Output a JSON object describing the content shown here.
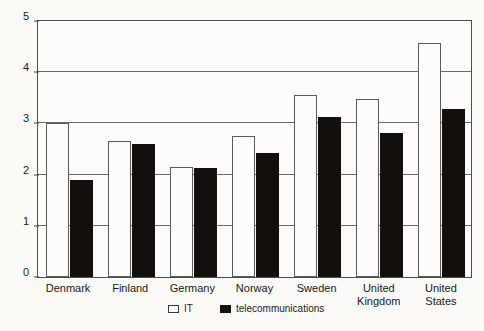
{
  "chart_data": {
    "type": "bar",
    "title": "",
    "subtitle": "",
    "xlabel": "",
    "ylabel": "",
    "ylim": [
      0,
      5
    ],
    "yticks": [
      0,
      1,
      2,
      3,
      4,
      5
    ],
    "ytick_labels": [
      "0",
      "1",
      "2",
      "3",
      "4",
      "5"
    ],
    "grid": "horizontal",
    "legend_position": "bottom-center",
    "categories": [
      "Denmark",
      "Finland",
      "Germany",
      "Norway",
      "Sweden",
      "United Kingdom",
      "United States"
    ],
    "series": [
      {
        "name": "IT",
        "color": "#ffffff",
        "edge_color": "#5b5b5b",
        "values": [
          3.0,
          2.65,
          2.15,
          2.75,
          3.56,
          3.48,
          4.58
        ]
      },
      {
        "name": "telecommunications",
        "color": "#120f0d",
        "edge_color": "#120f0d",
        "values": [
          1.9,
          2.6,
          2.13,
          2.42,
          3.12,
          2.82,
          3.28
        ]
      }
    ],
    "annotations": []
  },
  "legend": {
    "items": [
      {
        "label": "IT",
        "swatch": "white-square-outline"
      },
      {
        "label": "telecommunications",
        "swatch": "black-square-filled"
      }
    ]
  },
  "axis": {
    "y_tick_labels": [
      "5",
      "4",
      "3",
      "2",
      "1",
      "0"
    ]
  }
}
